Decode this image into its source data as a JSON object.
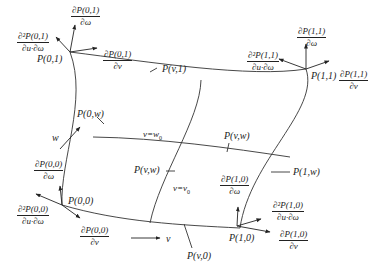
{
  "diagram": {
    "type": "bicubic surface patch (Coons/Hermite) with corner tangent and twist vectors",
    "corners": {
      "p00": "P(0,0)",
      "p01": "P(0,1)",
      "p10": "P(1,0)",
      "p11": "P(1,1)"
    },
    "edge_points": {
      "p0w": "P(0,w)",
      "pv1": "P(v,1)",
      "p1w": "P(1,w)",
      "pv0": "P(v,0)",
      "pvw_top": "P(v,w)",
      "pvw_left": "P(v,w)"
    },
    "iso_curves": {
      "w_curve": "v=w",
      "w_curve_sub": "0",
      "v_curve": "v=v",
      "v_curve_sub": "0"
    },
    "axes": {
      "v_axis": "v",
      "w_axis": "w"
    },
    "derivatives": {
      "d01_w": {
        "num": "∂P(0,1)",
        "den": "∂ω"
      },
      "d01_v": {
        "num": "∂P(0,1)",
        "den": "∂v"
      },
      "d01_uw": {
        "num": "∂²P(0,1)",
        "den": "∂u·∂ω"
      },
      "d11_w": {
        "num": "∂P(1,1)",
        "den": "∂ω"
      },
      "d11_v": {
        "num": "∂P(1,1)",
        "den": "∂v"
      },
      "d11_uw": {
        "num": "∂²P(1,1)",
        "den": "∂u·∂ω"
      },
      "d00_w": {
        "num": "∂P(0,0)",
        "den": "∂ω"
      },
      "d00_v": {
        "num": "∂P(0,0)",
        "den": "∂v"
      },
      "d00_uw": {
        "num": "∂²P(0,0)",
        "den": "∂u·∂ω"
      },
      "d10_w": {
        "num": "∂P(1,0)",
        "den": "∂ω"
      },
      "d10_v": {
        "num": "∂P(1,0)",
        "den": "∂v"
      },
      "d10_uw": {
        "num": "∂²P(1,0)",
        "den": "∂u·∂ω"
      }
    }
  }
}
